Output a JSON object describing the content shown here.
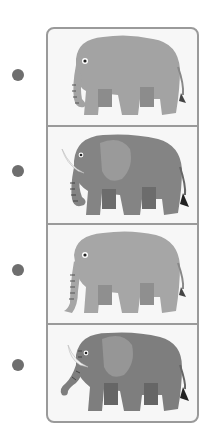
{
  "items": [
    {
      "id": 1,
      "label": "elephant-no-tusks-light",
      "tusks": false,
      "body_color": "#a3a3a3",
      "ear_color": "#a3a3a3"
    },
    {
      "id": 2,
      "label": "elephant-with-tusks-dark",
      "tusks": true,
      "body_color": "#848484",
      "ear_color": "#9a9a9a"
    },
    {
      "id": 3,
      "label": "elephant-no-tusks-light",
      "tusks": false,
      "body_color": "#a6a6a6",
      "ear_color": "#a6a6a6"
    },
    {
      "id": 4,
      "label": "elephant-with-tusks-dark",
      "tusks": true,
      "body_color": "#7e7e7e",
      "ear_color": "#969696"
    }
  ],
  "colors": {
    "dot": "#6e6e6e",
    "frame_border": "#9a9a9a",
    "panel_bg": "#f7f7f7"
  }
}
